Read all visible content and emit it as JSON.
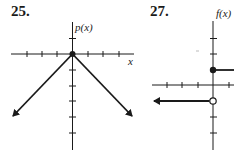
{
  "problems": [
    {
      "number": "25.",
      "function_label": "p(x)",
      "x_label": "x",
      "description": "Graph of p(x) = -|x|: inverted V with vertex at origin, arrows pointing down-left and down-right"
    },
    {
      "number": "27.",
      "function_label": "f(x)",
      "x_label": "",
      "description": "Step function: f(x)=1 for x>=0 (closed dot at (0,1), ray to the right); f(x)=-1 for x<0 (open circle at (0,-1), ray to the left with arrow)"
    }
  ],
  "colors": {
    "ink": "#1a1a1a",
    "background": "#ffffff"
  }
}
